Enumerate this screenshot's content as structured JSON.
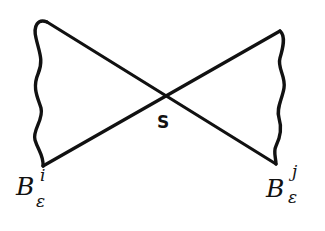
{
  "diagram": {
    "center_label": "S",
    "left_region": {
      "base": "B",
      "subscript": "ε",
      "superscript": "i"
    },
    "right_region": {
      "base": "B",
      "subscript": "ε",
      "superscript": "j"
    },
    "colors": {
      "stroke": "#111111",
      "background": "#ffffff"
    }
  }
}
